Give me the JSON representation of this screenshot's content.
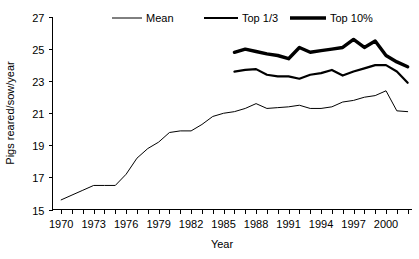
{
  "chart_data": {
    "type": "line",
    "title": "",
    "xlabel": "Year",
    "ylabel": "Pigs reared/sow/year",
    "xlim": [
      1969.2,
      2002.4
    ],
    "ylim": [
      15,
      27
    ],
    "grid": false,
    "legend_position": "top",
    "y_ticks": [
      15,
      17,
      19,
      21,
      23,
      25,
      27
    ],
    "y_tick_labels": [
      "15",
      "17",
      "19",
      "21",
      "23",
      "25",
      "27"
    ],
    "x_tick_labels": [
      "1970",
      "1973",
      "1976",
      "1979",
      "1982",
      "1985",
      "1988",
      "1991",
      "1994",
      "1997",
      "2000"
    ],
    "x_tick_label_years": [
      1970,
      1973,
      1976,
      1979,
      1982,
      1985,
      1988,
      1991,
      1994,
      1997,
      2000
    ],
    "x_minor_tick_years": [
      1970,
      1971,
      1972,
      1973,
      1974,
      1975,
      1976,
      1977,
      1978,
      1979,
      1980,
      1981,
      1982,
      1983,
      1984,
      1985,
      1986,
      1987,
      1988,
      1989,
      1990,
      1991,
      1992,
      1993,
      1994,
      1995,
      1996,
      1997,
      1998,
      1999,
      2000,
      2001,
      2002
    ],
    "series": [
      {
        "name": "Mean",
        "line_weight": "thin",
        "stroke_width": 1,
        "color": "#000000",
        "x": [
          1970,
          1971,
          1972,
          1973,
          1974,
          1975,
          1976,
          1977,
          1978,
          1979,
          1980,
          1981,
          1982,
          1983,
          1984,
          1985,
          1986,
          1987,
          1988,
          1989,
          1990,
          1991,
          1992,
          1993,
          1994,
          1995,
          1996,
          1997,
          1998,
          1999,
          2000,
          2001,
          2002
        ],
        "values": [
          15.6,
          15.9,
          16.2,
          16.5,
          16.5,
          16.5,
          17.2,
          18.2,
          18.8,
          19.2,
          19.8,
          19.9,
          19.9,
          20.3,
          20.8,
          21.0,
          21.1,
          21.3,
          21.6,
          21.3,
          21.35,
          21.4,
          21.5,
          21.3,
          21.3,
          21.4,
          21.7,
          21.8,
          22.0,
          22.1,
          22.4,
          21.15,
          21.1
        ]
      },
      {
        "name": "Top 1/3",
        "line_weight": "medium",
        "stroke_width": 2.2,
        "color": "#000000",
        "x": [
          1986,
          1987,
          1988,
          1989,
          1990,
          1991,
          1992,
          1993,
          1994,
          1995,
          1996,
          1997,
          1998,
          1999,
          2000,
          2001,
          2002
        ],
        "values": [
          23.6,
          23.7,
          23.75,
          23.4,
          23.3,
          23.3,
          23.15,
          23.4,
          23.5,
          23.7,
          23.35,
          23.6,
          23.8,
          24.0,
          24.0,
          23.6,
          22.9
        ]
      },
      {
        "name": "Top 10%",
        "line_weight": "thick",
        "stroke_width": 3.4,
        "color": "#000000",
        "x": [
          1986,
          1987,
          1988,
          1989,
          1990,
          1991,
          1992,
          1993,
          1994,
          1995,
          1996,
          1997,
          1998,
          1999,
          2000,
          2001,
          2002
        ],
        "values": [
          24.8,
          25.0,
          24.85,
          24.7,
          24.6,
          24.4,
          25.1,
          24.8,
          24.9,
          25.0,
          25.1,
          25.6,
          25.1,
          25.5,
          24.6,
          24.2,
          23.9
        ]
      }
    ],
    "legend_entries": [
      {
        "label": "Mean",
        "stroke_width": 1
      },
      {
        "label": "Top 1/3",
        "stroke_width": 2.2
      },
      {
        "label": "Top 10%",
        "stroke_width": 3.4
      }
    ]
  }
}
